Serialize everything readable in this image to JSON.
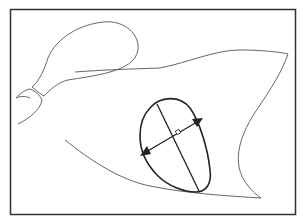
{
  "figure": {
    "title": "",
    "colors": {
      "frame": "#333333",
      "outline": "#555555",
      "ellipse": "#222222",
      "background": "#ffffff"
    },
    "elements": [
      {
        "name": "frame",
        "type": "rectangle"
      },
      {
        "name": "bulb-shape",
        "type": "outline"
      },
      {
        "name": "wedge-shape",
        "type": "outline"
      },
      {
        "name": "ovoid-region",
        "type": "outline"
      },
      {
        "name": "long-axis",
        "type": "line"
      },
      {
        "name": "short-axis",
        "type": "double-arrow"
      },
      {
        "name": "right-angle-marker",
        "type": "marker"
      }
    ]
  }
}
